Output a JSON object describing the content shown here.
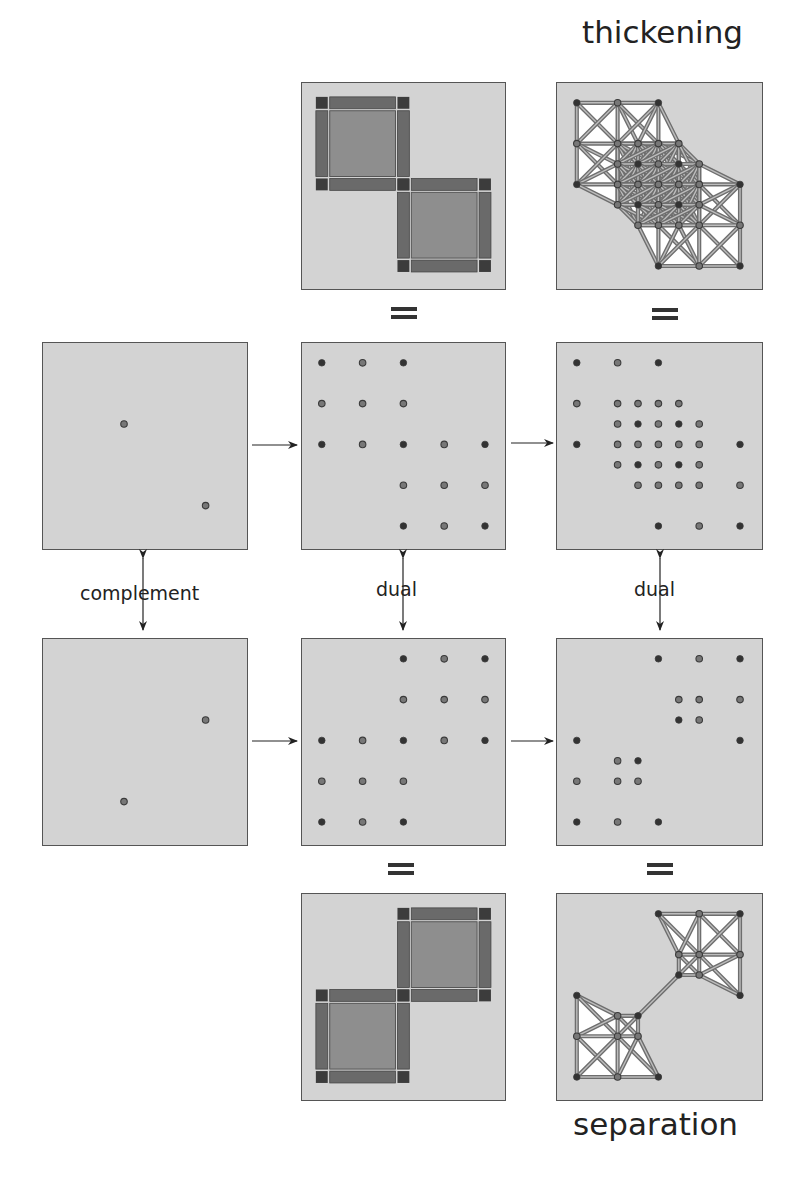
{
  "labels": {
    "top": "thickening",
    "bottom": "separation",
    "complement": "complement",
    "dual_middle": "dual",
    "dual_right": "dual"
  },
  "colors": {
    "panel_bg": "#d3d3d3",
    "panel_border": "#555555",
    "dot_dark": "#333333",
    "dot_light": "#777777",
    "block_corner": "#3c3c3c",
    "block_edge": "#6a6a6a",
    "block_center": "#8e8e8e",
    "mesh_line": "#6e6e6e",
    "mesh_fill": "#ffffff"
  },
  "panels": {
    "row1_left": {
      "points": [
        [
          1.5,
          1.5,
          "l"
        ],
        [
          3.5,
          3.5,
          "l"
        ]
      ]
    },
    "row1_mid": {
      "points": [
        [
          0,
          0,
          "d"
        ],
        [
          1,
          0,
          "l"
        ],
        [
          2,
          0,
          "d"
        ],
        [
          0,
          1,
          "l"
        ],
        [
          1,
          1,
          "l"
        ],
        [
          2,
          1,
          "l"
        ],
        [
          0,
          2,
          "d"
        ],
        [
          1,
          2,
          "l"
        ],
        [
          2,
          2,
          "d"
        ],
        [
          3,
          2,
          "l"
        ],
        [
          4,
          2,
          "d"
        ],
        [
          2,
          3,
          "l"
        ],
        [
          3,
          3,
          "l"
        ],
        [
          4,
          3,
          "l"
        ],
        [
          2,
          4,
          "d"
        ],
        [
          3,
          4,
          "l"
        ],
        [
          4,
          4,
          "d"
        ]
      ]
    },
    "row1_right": {
      "points": [
        [
          0,
          0,
          "d"
        ],
        [
          1,
          0,
          "l"
        ],
        [
          2,
          0,
          "d"
        ],
        [
          0,
          1,
          "l"
        ],
        [
          1,
          1,
          "l"
        ],
        [
          1.5,
          1,
          "l"
        ],
        [
          2,
          1,
          "l"
        ],
        [
          2.5,
          1,
          "l"
        ],
        [
          1,
          1.5,
          "l"
        ],
        [
          1.5,
          1.5,
          "d"
        ],
        [
          2,
          1.5,
          "l"
        ],
        [
          2.5,
          1.5,
          "d"
        ],
        [
          3,
          1.5,
          "l"
        ],
        [
          0,
          2,
          "d"
        ],
        [
          1,
          2,
          "l"
        ],
        [
          1.5,
          2,
          "l"
        ],
        [
          2,
          2,
          "l"
        ],
        [
          2.5,
          2,
          "l"
        ],
        [
          3,
          2,
          "l"
        ],
        [
          4,
          2,
          "d"
        ],
        [
          1,
          2.5,
          "l"
        ],
        [
          1.5,
          2.5,
          "d"
        ],
        [
          2,
          2.5,
          "l"
        ],
        [
          2.5,
          2.5,
          "d"
        ],
        [
          3,
          2.5,
          "l"
        ],
        [
          1.5,
          3,
          "l"
        ],
        [
          2,
          3,
          "l"
        ],
        [
          2.5,
          3,
          "l"
        ],
        [
          3,
          3,
          "l"
        ],
        [
          4,
          3,
          "l"
        ],
        [
          2,
          4,
          "d"
        ],
        [
          3,
          4,
          "l"
        ],
        [
          4,
          4,
          "d"
        ]
      ]
    },
    "row2_left": {
      "points": [
        [
          3.5,
          1.5,
          "l"
        ],
        [
          1.5,
          3.5,
          "l"
        ]
      ]
    },
    "row2_mid": {
      "points": [
        [
          2,
          0,
          "d"
        ],
        [
          3,
          0,
          "l"
        ],
        [
          4,
          0,
          "d"
        ],
        [
          2,
          1,
          "l"
        ],
        [
          3,
          1,
          "l"
        ],
        [
          4,
          1,
          "l"
        ],
        [
          0,
          2,
          "d"
        ],
        [
          1,
          2,
          "l"
        ],
        [
          2,
          2,
          "d"
        ],
        [
          3,
          2,
          "l"
        ],
        [
          4,
          2,
          "d"
        ],
        [
          0,
          3,
          "l"
        ],
        [
          1,
          3,
          "l"
        ],
        [
          2,
          3,
          "l"
        ],
        [
          0,
          4,
          "d"
        ],
        [
          1,
          4,
          "l"
        ],
        [
          2,
          4,
          "d"
        ]
      ]
    },
    "row2_right": {
      "points": [
        [
          2,
          0,
          "d"
        ],
        [
          3,
          0,
          "l"
        ],
        [
          4,
          0,
          "d"
        ],
        [
          2.5,
          1,
          "l"
        ],
        [
          3,
          1,
          "l"
        ],
        [
          4,
          1,
          "l"
        ],
        [
          2.5,
          1.5,
          "d"
        ],
        [
          3,
          1.5,
          "l"
        ],
        [
          0,
          2,
          "d"
        ],
        [
          4,
          2,
          "d"
        ],
        [
          1,
          2.5,
          "l"
        ],
        [
          1.5,
          2.5,
          "d"
        ],
        [
          0,
          3,
          "l"
        ],
        [
          1,
          3,
          "l"
        ],
        [
          1.5,
          3,
          "l"
        ],
        [
          0,
          4,
          "d"
        ],
        [
          1,
          4,
          "l"
        ],
        [
          2,
          4,
          "d"
        ]
      ]
    },
    "top_mid": {
      "blocks": [
        [
          0,
          0
        ],
        [
          2,
          2
        ]
      ]
    },
    "bottom_mid": {
      "blocks": [
        [
          2,
          0
        ],
        [
          0,
          2
        ]
      ]
    }
  }
}
